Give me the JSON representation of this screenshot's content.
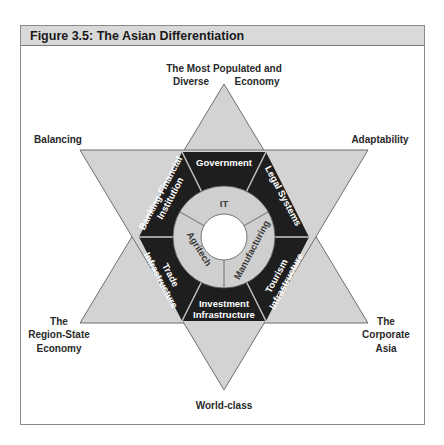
{
  "figure": {
    "title": "Figure 3.5:  The Asian Differentiation"
  },
  "outer_labels": {
    "top_line1": "The Most Populated and",
    "top_line2_left": "Diverse",
    "top_line2_right": "Economy",
    "upper_left": "Balancing",
    "upper_right": "Adaptability",
    "lower_left_line1": "The",
    "lower_left_line2": "Region-State",
    "lower_left_line3": "Economy",
    "lower_right_line1": "The",
    "lower_right_line2": "Corporate",
    "lower_right_line3": "Asia",
    "bottom": "World-class"
  },
  "hexagon_segments": {
    "top": "Government",
    "upper_right": "Legal Systems",
    "lower_right_line1": "Tourism",
    "lower_right_line2": "Infrastructure",
    "bottom_line1": "Investment",
    "bottom_line2": "Infrastructure",
    "lower_left_line1": "Trade",
    "lower_left_line2": "Infrastructure",
    "upper_left_line1": "Banking-Financial",
    "upper_left_line2": "Institution"
  },
  "inner_ring": {
    "top": "IT",
    "right": "Manufacturing",
    "left": "Agritech"
  },
  "colors": {
    "star_fill": "#d3d3d3",
    "star_stroke": "#6e6e6e",
    "band_fill": "#1e1e1e",
    "ring_fill": "#cfcfcf",
    "center_fill": "#ffffff",
    "title_bar": "#d9d9d9"
  }
}
